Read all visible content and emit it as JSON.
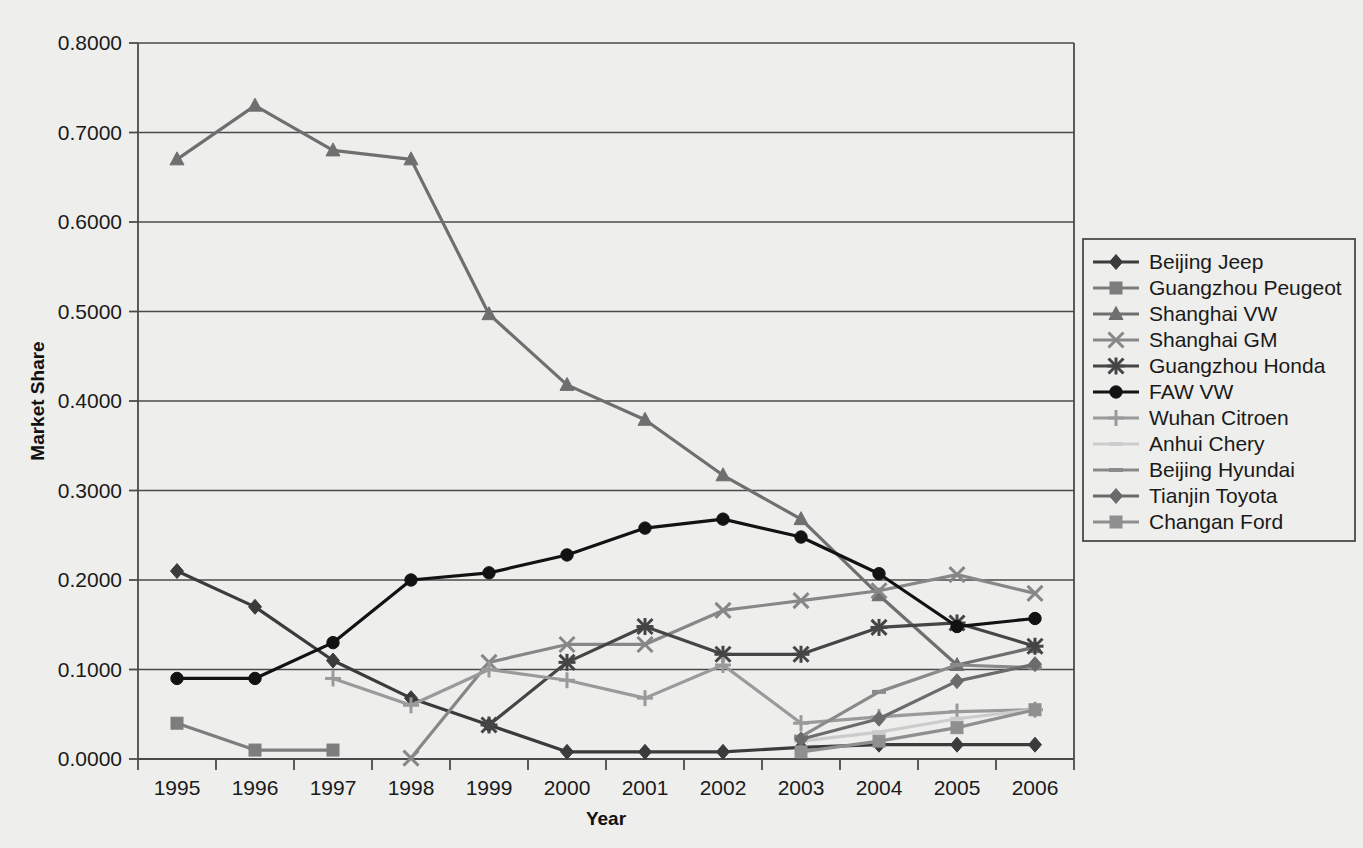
{
  "chart_data": {
    "type": "line",
    "title": "",
    "xlabel": "Year",
    "ylabel": "Market Share",
    "grid": true,
    "legend_position": "right",
    "x": [
      1995,
      1996,
      1997,
      1998,
      1999,
      2000,
      2001,
      2002,
      2003,
      2004,
      2005,
      2006
    ],
    "categories": [
      "1995",
      "1996",
      "1997",
      "1998",
      "1999",
      "2000",
      "2001",
      "2002",
      "2003",
      "2004",
      "2005",
      "2006"
    ],
    "ylim": [
      0.0,
      0.8
    ],
    "yticks": [
      0.0,
      0.1,
      0.2,
      0.3,
      0.4,
      0.5,
      0.6,
      0.7,
      0.8
    ],
    "ytick_labels": [
      "0.0000",
      "0.1000",
      "0.2000",
      "0.3000",
      "0.4000",
      "0.5000",
      "0.6000",
      "0.7000",
      "0.8000"
    ],
    "series": [
      {
        "name": "Beijing Jeep",
        "marker": "diamond",
        "color": "#3b3b3b",
        "values": [
          0.21,
          0.17,
          0.11,
          0.068,
          0.038,
          0.008,
          0.008,
          0.008,
          0.013,
          0.016,
          0.016,
          0.016
        ]
      },
      {
        "name": "Guangzhou Peugeot",
        "marker": "square",
        "color": "#7d7d7d",
        "values": [
          0.04,
          0.01,
          0.01,
          null,
          null,
          null,
          null,
          null,
          null,
          null,
          null,
          null
        ]
      },
      {
        "name": "Shanghai VW",
        "marker": "triangle",
        "color": "#6f6f6f",
        "values": [
          0.67,
          0.73,
          0.68,
          0.67,
          0.497,
          0.418,
          0.379,
          0.317,
          0.268,
          0.183,
          0.105,
          0.125
        ]
      },
      {
        "name": "Shanghai GM",
        "marker": "cross",
        "color": "#878787",
        "values": [
          null,
          null,
          null,
          0.001,
          0.108,
          0.128,
          0.128,
          0.166,
          0.177,
          0.188,
          0.206,
          0.185
        ]
      },
      {
        "name": "Guangzhou Honda",
        "marker": "star",
        "color": "#454545",
        "values": [
          null,
          null,
          null,
          null,
          0.038,
          0.108,
          0.148,
          0.117,
          0.117,
          0.147,
          0.152,
          0.126
        ]
      },
      {
        "name": "FAW VW",
        "marker": "circle",
        "color": "#121212",
        "values": [
          0.09,
          0.09,
          0.13,
          0.2,
          0.208,
          0.228,
          0.258,
          0.268,
          0.248,
          0.207,
          0.148,
          0.157
        ]
      },
      {
        "name": "Wuhan Citroen",
        "marker": "plus",
        "color": "#9a9a9a",
        "values": [
          null,
          null,
          0.09,
          0.06,
          0.1,
          0.088,
          0.068,
          0.105,
          0.04,
          0.047,
          0.053,
          0.055
        ]
      },
      {
        "name": "Anhui Chery",
        "marker": "dash",
        "color": "#cccccc",
        "values": [
          null,
          null,
          null,
          null,
          null,
          null,
          null,
          null,
          0.02,
          0.03,
          0.045,
          0.055
        ]
      },
      {
        "name": "Beijing Hyundai",
        "marker": "dash",
        "color": "#8a8a8a",
        "values": [
          null,
          null,
          null,
          null,
          null,
          null,
          null,
          null,
          0.025,
          0.075,
          0.105,
          0.102
        ]
      },
      {
        "name": "Tianjin Toyota",
        "marker": "diamond",
        "color": "#6b6b6b",
        "values": [
          null,
          null,
          null,
          null,
          null,
          null,
          null,
          null,
          0.022,
          0.045,
          0.087,
          0.106
        ]
      },
      {
        "name": "Changan Ford",
        "marker": "square",
        "color": "#8f8f8f",
        "values": [
          null,
          null,
          null,
          null,
          null,
          null,
          null,
          null,
          0.008,
          0.02,
          0.035,
          0.055
        ]
      }
    ]
  },
  "legend": {
    "items": [
      {
        "label": "Beijing Jeep"
      },
      {
        "label": "Guangzhou Peugeot"
      },
      {
        "label": "Shanghai VW"
      },
      {
        "label": "Shanghai GM"
      },
      {
        "label": "Guangzhou Honda"
      },
      {
        "label": "FAW VW"
      },
      {
        "label": "Wuhan Citroen"
      },
      {
        "label": "Anhui Chery"
      },
      {
        "label": "Beijing Hyundai"
      },
      {
        "label": "Tianjin Toyota"
      },
      {
        "label": "Changan Ford"
      }
    ]
  },
  "colors": {
    "background": "#eeeeec",
    "axis": "#4a4a4a",
    "text": "#1a1a1a"
  }
}
